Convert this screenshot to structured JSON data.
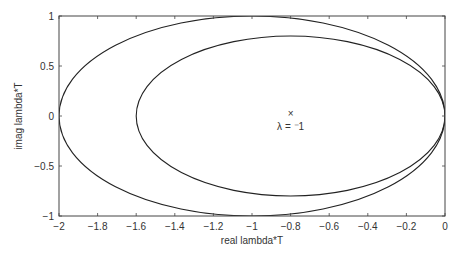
{
  "chart_data": {
    "type": "line",
    "title": "",
    "xlabel": "real lambda*T",
    "ylabel": "imag lambda*T",
    "xlim": [
      -2,
      0
    ],
    "ylim": [
      -1,
      1
    ],
    "grid": false,
    "xticks": [
      -2,
      -1.8,
      -1.6,
      -1.4,
      -1.2,
      -1,
      -0.8,
      -0.6,
      -0.4,
      -0.2,
      0
    ],
    "xtick_labels": [
      "-2",
      "-1.8",
      "-1.6",
      "-1.4",
      "-1.2",
      "-1",
      "-0.8",
      "-0.6",
      "-0.4",
      "-0.2",
      "0"
    ],
    "yticks": [
      1,
      0.5,
      0,
      -0.5,
      -1
    ],
    "ytick_labels": [
      "1",
      "0.5",
      "0",
      "-0.5",
      "-1"
    ],
    "series": [
      {
        "name": "outer stability boundary",
        "shape": "ellipse",
        "center": [
          -1,
          0
        ],
        "rx": 1.0,
        "ry": 1.0
      },
      {
        "name": "inner stability boundary",
        "shape": "ellipse",
        "center": [
          -0.8,
          0
        ],
        "rx": 0.8,
        "ry": 0.8
      }
    ],
    "markers": [
      {
        "x": -0.8,
        "y": 0.02,
        "symbol": "x"
      }
    ],
    "annotations": [
      {
        "text": "λ = -1",
        "x": -0.8,
        "y": -0.1
      }
    ]
  },
  "labels": {
    "xlabel": "real lambda*T",
    "ylabel": "imag lambda*T",
    "annotation": "λ = ⁻1",
    "marker": "×"
  }
}
